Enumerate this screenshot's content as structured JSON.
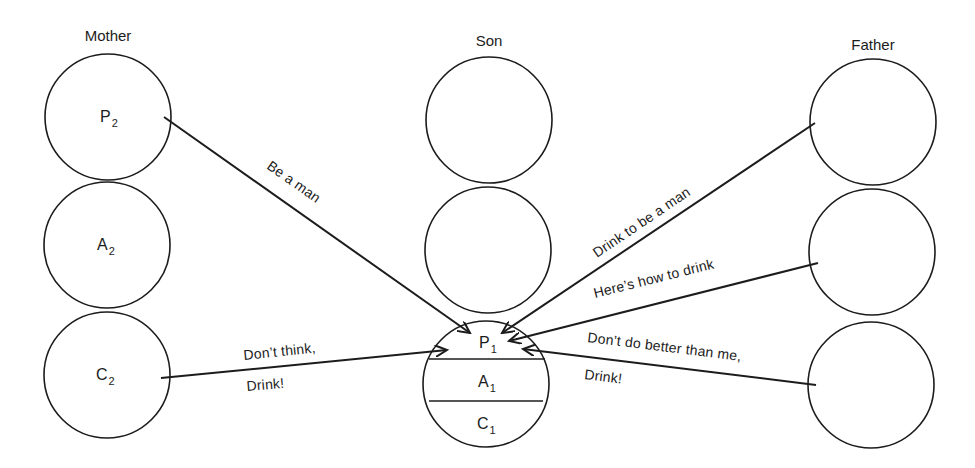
{
  "columns": {
    "mother": {
      "label": "Mother",
      "states": [
        "P",
        "A",
        "C"
      ],
      "subscript": "2"
    },
    "son": {
      "label": "Son",
      "states": [
        "P",
        "A",
        "C"
      ],
      "subscript": "1"
    },
    "father": {
      "label": "Father"
    }
  },
  "labels": {
    "mother_p": "P",
    "mother_a": "A",
    "mother_c": "C",
    "mother_sub": "2",
    "son_p": "P",
    "son_a": "A",
    "son_c": "C",
    "son_sub": "1"
  },
  "messages": {
    "be_a_man": "Be a man",
    "drink_to_be_a_man": "Drink to be a man",
    "heres_how": "Here’s how to drink",
    "dont_do_better_1": "Don’t do better than me,",
    "dont_do_better_2": "Drink!",
    "dont_think_1": "Don’t think,",
    "dont_think_2": "Drink!"
  }
}
